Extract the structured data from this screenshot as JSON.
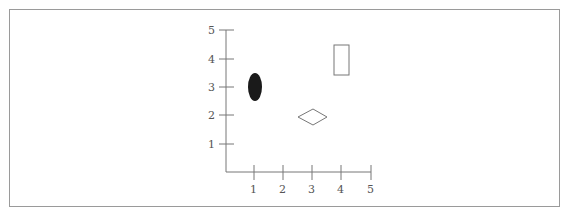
{
  "diagram": {
    "type": "coordinate-plot",
    "axes": {
      "x": {
        "min": 0,
        "max": 5,
        "ticks": [
          "1",
          "2",
          "3",
          "4",
          "5"
        ]
      },
      "y": {
        "min": 0,
        "max": 5,
        "ticks": [
          "1",
          "2",
          "3",
          "4",
          "5"
        ]
      }
    },
    "shapes": [
      {
        "name": "filled-ellipse",
        "shape": "ellipse",
        "fill": "#1a1a1a",
        "x": 1,
        "y": 3
      },
      {
        "name": "rectangle",
        "shape": "rectangle",
        "fill": "none",
        "x": 4,
        "y": 4
      },
      {
        "name": "diamond",
        "shape": "diamond",
        "fill": "none",
        "x": 3,
        "y": 2
      }
    ],
    "colors": {
      "axis": "#777777",
      "outline": "#777777",
      "frame": "#9a9a9a",
      "ellipse_fill": "#1a1a1a"
    }
  }
}
